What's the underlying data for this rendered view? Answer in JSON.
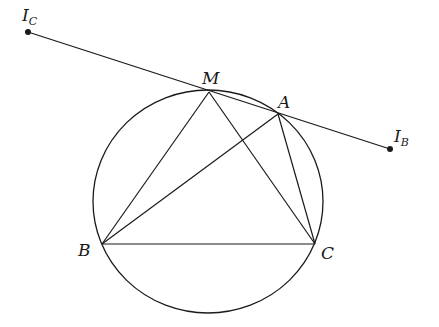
{
  "diagram": {
    "type": "geometry",
    "stroke_color": "#1a1a1a",
    "background": "#ffffff",
    "circle": {
      "cx": 208,
      "cy": 201.5,
      "rx": 115,
      "ry": 111.5
    },
    "points": {
      "IC": {
        "x": 28,
        "y": 32,
        "label": "I",
        "subscript": "C",
        "dot": true
      },
      "M": {
        "x": 209,
        "y": 92,
        "label": "M",
        "dot": false
      },
      "A": {
        "x": 278,
        "y": 114,
        "label": "A",
        "dot": false
      },
      "IB": {
        "x": 390,
        "y": 149,
        "label": "I",
        "subscript": "B",
        "dot": true
      },
      "B": {
        "x": 102,
        "y": 244,
        "label": "B",
        "dot": false
      },
      "C": {
        "x": 315,
        "y": 244,
        "label": "C",
        "dot": false
      }
    },
    "segments": [
      [
        "IC",
        "IB"
      ],
      [
        "M",
        "B"
      ],
      [
        "M",
        "C"
      ],
      [
        "A",
        "B"
      ],
      [
        "A",
        "C"
      ],
      [
        "B",
        "C"
      ]
    ]
  }
}
